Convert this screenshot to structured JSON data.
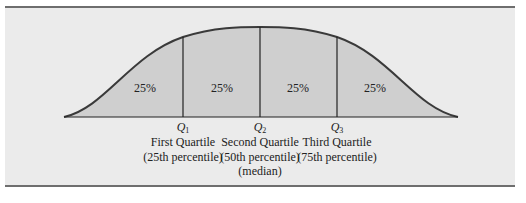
{
  "figure": {
    "segments": [
      {
        "label": "25%",
        "x": 145
      },
      {
        "label": "25%",
        "x": 222
      },
      {
        "label": "25%",
        "x": 298
      },
      {
        "label": "25%",
        "x": 375
      }
    ],
    "quartiles": [
      {
        "symbol": "Q",
        "sub": "1",
        "x": 183,
        "name": "First Quartile",
        "percentile": "(25th percentile)",
        "extra": ""
      },
      {
        "symbol": "Q",
        "sub": "2",
        "x": 260,
        "name": "Second Quartile",
        "percentile": "(50th percentile)",
        "extra": "(median)"
      },
      {
        "symbol": "Q",
        "sub": "3",
        "x": 337,
        "name": "Third Quartile",
        "percentile": "(75th percentile)",
        "extra": ""
      }
    ],
    "colors": {
      "panel": "#ebebeb",
      "fill": "#cfcfcf",
      "line": "#3a3a3a",
      "rule": "#6e6e6e"
    }
  }
}
